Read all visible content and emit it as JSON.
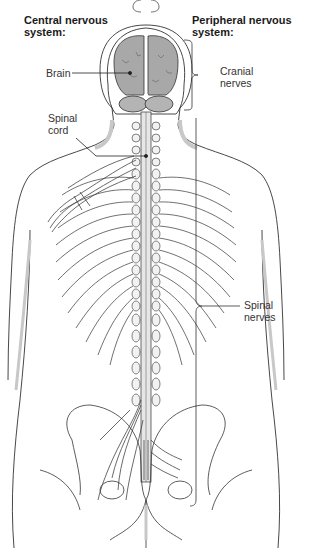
{
  "diagram": {
    "headings": {
      "central": "Central nervous system:",
      "central_line1": "Central nervous",
      "central_line2": "system:",
      "peripheral_line1": "Peripheral nervous",
      "peripheral_line2": "system:"
    },
    "labels": {
      "brain": "Brain",
      "spinal_cord_line1": "Spinal",
      "spinal_cord_line2": "cord",
      "cranial_nerves_line1": "Cranial",
      "cranial_nerves_line2": "nerves",
      "spinal_nerves_line1": "Spinal",
      "spinal_nerves_line2": "nerves"
    },
    "colors": {
      "brain_fill": "#a8a8a8",
      "outline": "#333333",
      "shadow": "#c8c8c8",
      "nerve_fill": "#e6e6e6"
    }
  }
}
